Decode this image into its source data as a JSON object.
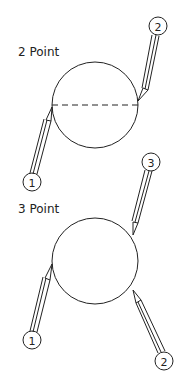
{
  "diagram": {
    "colors": {
      "line": "#222222",
      "background": "#ffffff"
    },
    "panels": [
      {
        "title": "2 Point",
        "circle": {
          "cx": 95,
          "cy": 105,
          "r": 43
        },
        "dashed_diameter": true,
        "callouts": [
          {
            "label": "1",
            "cx": 32,
            "cy": 182,
            "tip": [
              52,
              107
            ]
          },
          {
            "label": "2",
            "cx": 158,
            "cy": 26,
            "tip": [
              138,
              101
            ]
          }
        ]
      },
      {
        "title": "3 Point",
        "circle": {
          "cx": 95,
          "cy": 261,
          "r": 43
        },
        "dashed_diameter": false,
        "callouts": [
          {
            "label": "1",
            "cx": 32,
            "cy": 340,
            "tip": [
              52,
              264
            ]
          },
          {
            "label": "2",
            "cx": 164,
            "cy": 361,
            "tip": [
              133,
              290
            ]
          },
          {
            "label": "3",
            "cx": 151,
            "cy": 162,
            "tip": [
              133,
              235
            ]
          }
        ]
      }
    ]
  }
}
